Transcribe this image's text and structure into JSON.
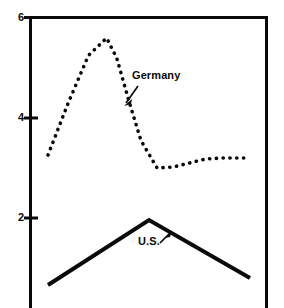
{
  "chart_data": {
    "type": "line",
    "title": "",
    "xlabel": "",
    "ylabel": "",
    "ylim": [
      0,
      6
    ],
    "xlim": [
      0,
      10
    ],
    "grid": false,
    "legend_position": "inline-annotations",
    "y_ticks": [
      {
        "value": 6,
        "label": "6"
      },
      {
        "value": 4,
        "label": "4"
      },
      {
        "value": 2,
        "label": "2"
      }
    ],
    "x_ticks": [],
    "series": [
      {
        "name": "Germany",
        "style": "dotted",
        "color": "#0a0a0a",
        "annotation": "Germany",
        "x": [
          0.0,
          1.0,
          2.0,
          2.9,
          3.4,
          4.0,
          4.6,
          5.4,
          6.2,
          7.0,
          7.8,
          8.6,
          9.2,
          10.0
        ],
        "values": [
          3.26,
          4.3,
          5.25,
          5.6,
          5.2,
          4.35,
          3.55,
          3.0,
          3.02,
          3.1,
          3.18,
          3.2,
          3.2,
          3.2
        ]
      },
      {
        "name": "U.S.",
        "style": "solid",
        "color": "#0a0a0a",
        "annotation": "U.S.",
        "x": [
          0.0,
          5.0,
          10.0
        ],
        "values": [
          0.66,
          1.96,
          0.8
        ]
      }
    ],
    "annotations": [
      {
        "text": "Germany",
        "target_series": "Germany",
        "arrow": true
      },
      {
        "text": "U.S.",
        "target_series": "U.S.",
        "arrow": true
      }
    ],
    "axis_style": {
      "left_axis": true,
      "top_border": true,
      "right_border": true,
      "bottom_border": false,
      "axis_color": "#0a0a0a"
    }
  }
}
